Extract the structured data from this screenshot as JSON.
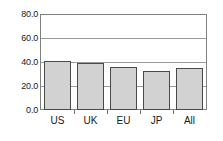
{
  "chart_data": {
    "type": "bar",
    "title": "",
    "subtitle": "",
    "xlabel": "",
    "ylabel": "",
    "categories": [
      "US",
      "UK",
      "EU",
      "JP",
      "All"
    ],
    "values": [
      41.5,
      39.5,
      36.5,
      33.0,
      35.0
    ],
    "series": [
      {
        "name": "",
        "values": [
          41.5,
          39.5,
          36.5,
          33.0,
          35.0
        ]
      }
    ],
    "ylim": [
      0.0,
      80.0
    ],
    "ytick_labels": [
      "80.0",
      "60.0",
      "40.0",
      "20.0",
      "0.0"
    ],
    "ytick_values": [
      80.0,
      60.0,
      40.0,
      20.0,
      0.0
    ],
    "gridline_values": [
      60.0,
      40.0,
      20.0
    ],
    "grid": true,
    "legend": false,
    "legend_position": "none",
    "annotations": [],
    "colors": {
      "bar_fill": "#d2d2d2",
      "bar_border": "#4a4a4a",
      "gridline": "#9a9a9a",
      "frame": "#808080",
      "text": "#1a1a1a",
      "background": "#ffffff"
    }
  }
}
